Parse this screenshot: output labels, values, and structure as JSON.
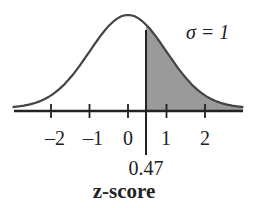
{
  "chart_data": {
    "type": "area",
    "title": "",
    "annotation": "σ = 1",
    "xlabel": "z-score",
    "ylabel": "",
    "distribution": "standard normal",
    "mean": 0,
    "sd": 1,
    "shaded_region": {
      "from": 0.47,
      "to": "inf",
      "color": "#999999"
    },
    "marker": {
      "value": 0.47,
      "label": "0.47"
    },
    "x_ticks": [
      -2,
      -1,
      0,
      1,
      2
    ],
    "x_tick_labels": [
      "–2",
      "–1",
      "0",
      "1",
      "2"
    ],
    "xlim": [
      -3,
      3
    ],
    "grid": false,
    "legend": null
  },
  "labels": {
    "sigma": "σ = 1",
    "xlabel": "z-score",
    "marker": "0.47",
    "ticks": [
      "–2",
      "–1",
      "0",
      "1",
      "2"
    ]
  }
}
